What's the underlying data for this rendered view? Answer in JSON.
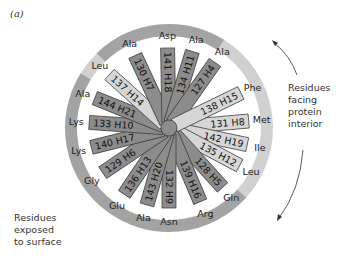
{
  "panel_label": "(a)",
  "notes": {
    "interior": [
      "Residues",
      "facing",
      "protein",
      "interior"
    ],
    "surface": [
      "Residues",
      "exposed",
      "to surface"
    ]
  },
  "colors": {
    "ring_dark": "#a3a3a3",
    "ring_light": "#d0d0d0",
    "spoke_dark": "#8c8c8c",
    "spoke_light": "#d6d6d6",
    "outline": "#333333",
    "text": "#222222"
  },
  "residues": [
    {
      "num": "131",
      "pos": "H8",
      "aa": "Met",
      "angle": -5,
      "shade": "light"
    },
    {
      "num": "142",
      "pos": "H19",
      "aa": "Ile",
      "angle": 12,
      "shade": "light"
    },
    {
      "num": "135",
      "pos": "H12",
      "aa": "Leu",
      "angle": 28,
      "shade": "light"
    },
    {
      "num": "128",
      "pos": "H5",
      "aa": "Gln",
      "angle": 48,
      "shade": "dark"
    },
    {
      "num": "139",
      "pos": "H16",
      "aa": "Arg",
      "angle": 67,
      "shade": "dark"
    },
    {
      "num": "132",
      "pos": "H9",
      "aa": "Asn",
      "angle": 90,
      "shade": "dark"
    },
    {
      "num": "143",
      "pos": "H20",
      "aa": "Ala",
      "angle": 106,
      "shade": "dark"
    },
    {
      "num": "136",
      "pos": "H13",
      "aa": "Glu",
      "angle": 124,
      "shade": "dark"
    },
    {
      "num": "129",
      "pos": "H6",
      "aa": "Gly",
      "angle": 146,
      "shade": "dark"
    },
    {
      "num": "140",
      "pos": "H17",
      "aa": "Lys",
      "angle": 166,
      "shade": "dark"
    },
    {
      "num": "133",
      "pos": "H10",
      "aa": "Lys",
      "angle": 184,
      "shade": "dark"
    },
    {
      "num": "144",
      "pos": "H21",
      "aa": "Ala",
      "angle": 202,
      "shade": "dark"
    },
    {
      "num": "137",
      "pos": "H14",
      "aa": "Leu",
      "angle": 222,
      "shade": "light"
    },
    {
      "num": "130",
      "pos": "H7",
      "aa": "Ala",
      "angle": 245,
      "shade": "dark"
    },
    {
      "num": "141",
      "pos": "H18",
      "aa": "Asp",
      "angle": 269,
      "shade": "dark"
    },
    {
      "num": "134",
      "pos": "H11",
      "aa": "Ala",
      "angle": 287,
      "shade": "dark"
    },
    {
      "num": "127",
      "pos": "H4",
      "aa": "Ala",
      "angle": 305,
      "shade": "dark"
    },
    {
      "num": "138",
      "pos": "H15",
      "aa": "Phe",
      "angle": 334,
      "shade": "light"
    }
  ]
}
